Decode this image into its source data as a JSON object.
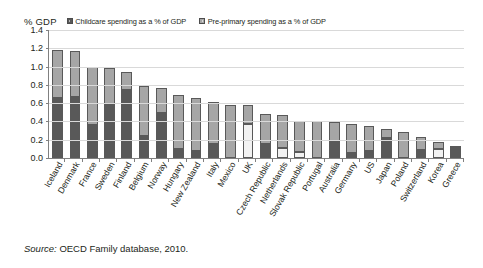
{
  "axis_unit_label": "% GDP",
  "legend": {
    "items": [
      {
        "label": "Childcare spending as a % of GDP",
        "color": "#595959",
        "name": "childcare"
      },
      {
        "label": "Pre-primary spending as a % of GDP",
        "color": "#a6a6a6",
        "name": "pre-primary"
      }
    ]
  },
  "source": {
    "prefix": "Source:",
    "text": " OECD Family database, 2010."
  },
  "chart_data": {
    "type": "bar",
    "stacked": true,
    "title": "",
    "subtitle": "",
    "xlabel": "",
    "ylabel": "% GDP",
    "ylim": [
      0,
      1.4
    ],
    "ytick_step": 0.2,
    "yticks": [
      "1.4",
      "1.2",
      "1.0",
      "0.8",
      "0.6",
      "0.4",
      "0.2",
      "0.0"
    ],
    "grid": "horizontal",
    "legend_position": "top",
    "categories": [
      "Iceland",
      "Denmark",
      "France",
      "Sweden",
      "Finland",
      "Belgium",
      "Norway",
      "Hungary",
      "New Zealand",
      "Italy",
      "Mexico",
      "UK",
      "Czech Republic",
      "Netherlands",
      "Slovak Republic",
      "Portugal",
      "Australia",
      "Germany",
      "US",
      "Japan",
      "Poland",
      "Switzerland",
      "Korea",
      "Greece"
    ],
    "series": [
      {
        "name": "Childcare spending as a % of GDP",
        "color": "#595959",
        "values": [
          0.66,
          0.67,
          0.36,
          0.58,
          0.74,
          0.24,
          0.49,
          0.1,
          0.08,
          0.15,
          0.0,
          0.37,
          0.15,
          0.11,
          0.07,
          0.0,
          0.18,
          0.06,
          0.08,
          0.22,
          0.0,
          0.09,
          0.1,
          0.13
        ]
      },
      {
        "name": "Pre-primary spending as a % of GDP",
        "color": "#a6a6a6",
        "values": [
          0.52,
          0.5,
          0.64,
          0.4,
          0.2,
          0.55,
          0.28,
          0.59,
          0.58,
          0.46,
          0.58,
          0.21,
          0.33,
          0.36,
          0.34,
          0.4,
          0.21,
          0.31,
          0.27,
          0.1,
          0.29,
          0.14,
          0.07,
          0.0
        ]
      }
    ],
    "totals": [
      1.18,
      1.17,
      1.0,
      0.98,
      0.94,
      0.79,
      0.77,
      0.69,
      0.66,
      0.61,
      0.58,
      0.58,
      0.48,
      0.47,
      0.41,
      0.4,
      0.39,
      0.37,
      0.35,
      0.32,
      0.29,
      0.23,
      0.17,
      0.13
    ],
    "light_childcare_indices": [
      11,
      13,
      14,
      22
    ]
  }
}
